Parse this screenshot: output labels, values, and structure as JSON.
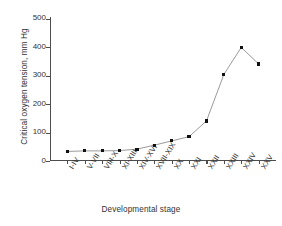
{
  "chart_data": {
    "type": "line",
    "title": "",
    "xlabel": "Developmental stage",
    "ylabel": "Critical oxygen tension, mm Hg",
    "categories": [
      "I-IV",
      "V-VII",
      "VIII-X",
      "XI-XIII",
      "XIV-XVI",
      "XVII-XIX",
      "XX",
      "XXI",
      "XXII",
      "XXIII",
      "XXIV",
      "XXV"
    ],
    "values": [
      30,
      32,
      32,
      33,
      38,
      52,
      67,
      82,
      137,
      300,
      395,
      337
    ],
    "ylim": [
      0,
      500
    ],
    "yticks": [
      0,
      100,
      200,
      300,
      400,
      500
    ],
    "ytick_labels": [
      "0",
      "100",
      "200",
      "300",
      "400",
      "500"
    ],
    "grid": false,
    "legend": false,
    "marker": "square",
    "marker_color": "#111111",
    "line_color": "#808080",
    "axis_color": "#4d4d4d",
    "background": "#ffffff"
  }
}
